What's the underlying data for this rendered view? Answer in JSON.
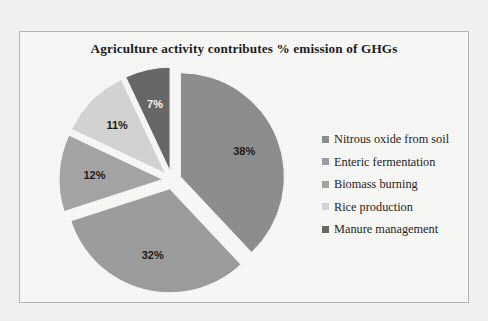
{
  "chart_data": {
    "type": "pie",
    "title": "Agriculture activity contributes % emission of GHGs",
    "xlabel": "",
    "ylabel": "",
    "exploded": true,
    "legend_position": "right",
    "grid": false,
    "categories": [
      "Nitrous oxide from soil",
      "Enteric fermentation",
      "Biomass burning",
      "Rice production",
      "Manure management"
    ],
    "values": [
      38,
      32,
      12,
      11,
      7
    ],
    "data_labels": [
      "38%",
      "32%",
      "12%",
      "11%",
      "7%"
    ],
    "colors": [
      "#919191",
      "#a0a0a0",
      "#a8a8a8",
      "#d8d8d8",
      "#6a6a6a"
    ],
    "label_colors": [
      "dark",
      "dark",
      "dark",
      "dark",
      "light"
    ]
  },
  "legend": {
    "items": [
      {
        "label": "Nitrous oxide from soil",
        "color": "#919191"
      },
      {
        "label": "Enteric fermentation",
        "color": "#a0a0a0"
      },
      {
        "label": "Biomass burning",
        "color": "#a8a8a8"
      },
      {
        "label": "Rice production",
        "color": "#d8d8d8"
      },
      {
        "label": "Manure management",
        "color": "#6a6a6a"
      }
    ]
  }
}
